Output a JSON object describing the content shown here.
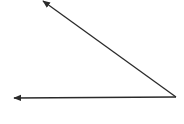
{
  "diagram": {
    "type": "angle",
    "stroke_color": "#2a2a2a",
    "background": "#ffffff",
    "vertex": {
      "x": 176,
      "y": 97
    },
    "rays": [
      {
        "name": "upper-ray",
        "to": {
          "x": 43,
          "y": 1
        }
      },
      {
        "name": "lower-ray",
        "to": {
          "x": 14,
          "y": 98
        }
      }
    ]
  }
}
